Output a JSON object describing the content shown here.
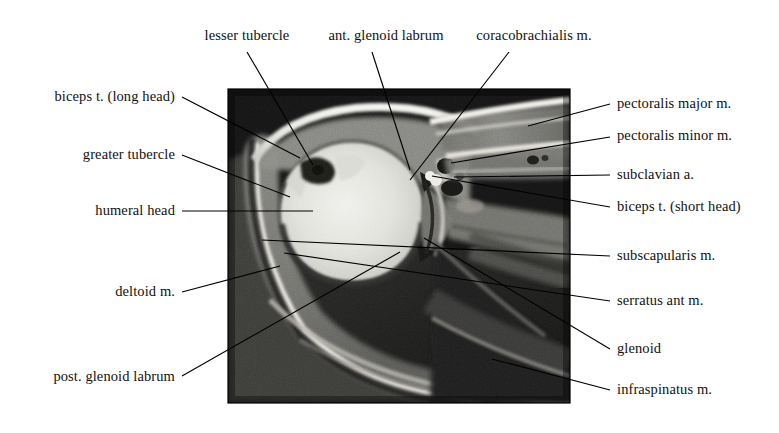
{
  "figure": {
    "background_color": "#ffffff",
    "text_color": "#111111",
    "leader_color": "#000000"
  },
  "scan": {
    "name": "axial-shoulder-mri",
    "x": 228,
    "y": 89,
    "width": 342,
    "height": 314,
    "modality_look": "grayscale T1 axial MRI",
    "border_color": "#000000"
  },
  "labels": [
    {
      "id": "lesser-tubercle",
      "text": "lesser tubercle",
      "side": "top",
      "text_x": 247,
      "text_y": 40,
      "leader": [
        [
          247,
          52
        ],
        [
          313,
          165
        ]
      ]
    },
    {
      "id": "ant-glenoid-labrum",
      "text": "ant. glenoid labrum",
      "side": "top",
      "text_x": 386,
      "text_y": 40,
      "leader": [
        [
          372,
          52
        ],
        [
          410,
          170
        ]
      ]
    },
    {
      "id": "coracobrachialis-m",
      "text": "coracobrachialis m.",
      "side": "top",
      "text_x": 534,
      "text_y": 40,
      "leader": [
        [
          509,
          52
        ],
        [
          410,
          180
        ]
      ]
    },
    {
      "id": "biceps-t-long-head",
      "text": "biceps t. (long head)",
      "side": "left",
      "text_x": 175,
      "text_y": 101,
      "leader": [
        [
          182,
          97
        ],
        [
          300,
          158
        ]
      ]
    },
    {
      "id": "greater-tubercle",
      "text": "greater tubercle",
      "side": "left",
      "text_x": 175,
      "text_y": 159,
      "leader": [
        [
          182,
          155
        ],
        [
          290,
          197
        ]
      ]
    },
    {
      "id": "humeral-head",
      "text": "humeral head",
      "side": "left",
      "text_x": 175,
      "text_y": 215,
      "leader": [
        [
          182,
          211
        ],
        [
          313,
          211
        ]
      ]
    },
    {
      "id": "deltoid-m",
      "text": "deltoid m.",
      "side": "left",
      "text_x": 175,
      "text_y": 296,
      "leader": [
        [
          182,
          292
        ],
        [
          280,
          266
        ]
      ]
    },
    {
      "id": "post-glenoid-labrum",
      "text": "post. glenoid labrum",
      "side": "left",
      "text_x": 175,
      "text_y": 381,
      "leader": [
        [
          182,
          376
        ],
        [
          400,
          252
        ]
      ]
    },
    {
      "id": "pectoralis-major-m",
      "text": "pectoralis major m.",
      "side": "right",
      "text_x": 617,
      "text_y": 108,
      "leader": [
        [
          610,
          104
        ],
        [
          528,
          126
        ]
      ]
    },
    {
      "id": "pectoralis-minor-m",
      "text": "pectoralis minor m.",
      "side": "right",
      "text_x": 617,
      "text_y": 140,
      "leader": [
        [
          610,
          137
        ],
        [
          451,
          163
        ]
      ]
    },
    {
      "id": "subclavian-a",
      "text": "subclavian a.",
      "side": "right",
      "text_x": 617,
      "text_y": 179,
      "leader": [
        [
          610,
          175
        ],
        [
          454,
          177
        ]
      ]
    },
    {
      "id": "biceps-t-short-head",
      "text": "biceps t. (short head)",
      "side": "right",
      "text_x": 617,
      "text_y": 211,
      "leader": [
        [
          610,
          207
        ],
        [
          432,
          176
        ]
      ]
    },
    {
      "id": "subscapularis-m",
      "text": "subscapularis m.",
      "side": "right",
      "text_x": 617,
      "text_y": 260,
      "leader": [
        [
          610,
          256
        ],
        [
          262,
          240
        ]
      ]
    },
    {
      "id": "serratus-ant-m",
      "text": "serratus ant m.",
      "side": "right",
      "text_x": 617,
      "text_y": 305,
      "leader": [
        [
          610,
          301
        ],
        [
          284,
          253
        ]
      ]
    },
    {
      "id": "glenoid",
      "text": "glenoid",
      "side": "right",
      "text_x": 617,
      "text_y": 353,
      "leader": [
        [
          610,
          349
        ],
        [
          424,
          238
        ]
      ]
    },
    {
      "id": "infraspinatus-m",
      "text": "infraspinatus m.",
      "side": "right",
      "text_x": 617,
      "text_y": 394,
      "leader": [
        [
          610,
          390
        ],
        [
          492,
          359
        ]
      ]
    }
  ]
}
